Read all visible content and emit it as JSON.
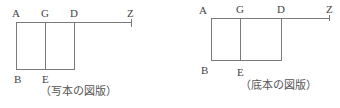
{
  "figures": [
    {
      "id": "left",
      "labels": {
        "A": "A",
        "G": "G",
        "D": "D",
        "Z": "Z",
        "B": "B",
        "E": "E"
      },
      "caption": "（写本の図版）"
    },
    {
      "id": "right",
      "labels": {
        "A": "A",
        "G": "G",
        "D": "D",
        "Z": "Z",
        "B": "B",
        "E": "E"
      },
      "caption": "（底本の図版）"
    }
  ]
}
